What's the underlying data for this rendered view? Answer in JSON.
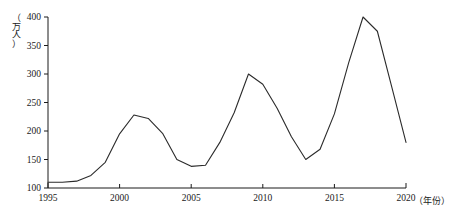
{
  "chart_data": {
    "type": "line",
    "title": "",
    "xlabel": "（年份）",
    "ylabel": "（万人）",
    "xlim": [
      1995,
      2020
    ],
    "ylim": [
      100,
      400
    ],
    "grid": false,
    "legend": "none",
    "line_color": "#2b2b2b",
    "x_ticks": [
      "1995",
      "2000",
      "2005",
      "2010",
      "2015",
      "2020"
    ],
    "y_ticks": [
      "100",
      "150",
      "200",
      "250",
      "300",
      "350",
      "400"
    ],
    "x": [
      1995,
      1996,
      1997,
      1998,
      1999,
      2000,
      2001,
      2002,
      2003,
      2004,
      2005,
      2006,
      2007,
      2008,
      2009,
      2010,
      2011,
      2012,
      2013,
      2014,
      2015,
      2016,
      2017,
      2018,
      2019,
      2020
    ],
    "values": [
      110,
      110,
      112,
      122,
      145,
      195,
      228,
      222,
      196,
      150,
      138,
      140,
      180,
      232,
      300,
      282,
      240,
      190,
      150,
      168,
      230,
      320,
      400,
      375,
      278,
      180
    ],
    "series": [
      {
        "name": "人数",
        "values": [
          110,
          110,
          112,
          122,
          145,
          195,
          228,
          222,
          196,
          150,
          138,
          140,
          180,
          232,
          300,
          282,
          240,
          190,
          150,
          168,
          230,
          320,
          400,
          375,
          278,
          180
        ]
      }
    ],
    "annotations": []
  },
  "axes": {
    "y_unit_chars": [
      "（",
      "万",
      "人",
      "）"
    ],
    "x_unit_text": "（年份）"
  }
}
